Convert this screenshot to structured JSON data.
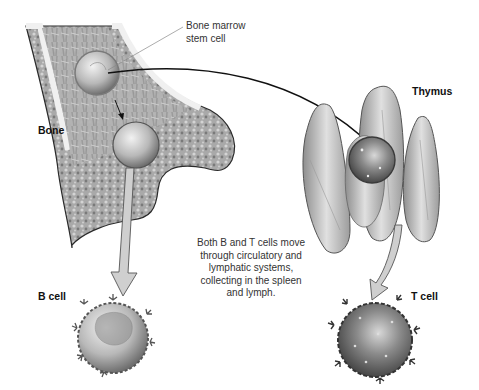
{
  "diagram": {
    "labels": {
      "bone": "Bone",
      "stem_cell_line1": "Bone marrow",
      "stem_cell_line2": "stem cell",
      "thymus": "Thymus",
      "b_cell": "B cell",
      "t_cell": "T cell"
    },
    "caption": {
      "line1": "Both B and T cells move",
      "line2": "through circulatory and",
      "line3": "lymphatic systems,",
      "line4": "collecting in the spleen",
      "line5": "and lymph."
    },
    "colors": {
      "background": "#ffffff",
      "bone_outline": "#2a2a2a",
      "marrow_fill": "#bdbdbd",
      "spongy_bone": "#9a9a9a",
      "thymus_fill": "#c8c8c8",
      "cell_dark": "#5a5a5a",
      "arrow_fill": "#c9c9c9"
    }
  }
}
